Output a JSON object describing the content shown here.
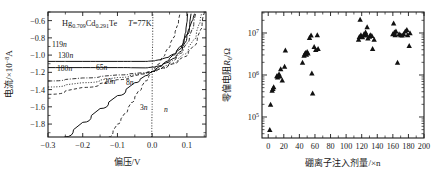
{
  "figure": {
    "panels": [
      "left",
      "right"
    ]
  },
  "left_panel": {
    "annotation_material": "Hg",
    "annotation_material_x": "0.709",
    "annotation_material_cd": "Cd",
    "annotation_material_cd_x": "0.291",
    "annotation_material_te": "Te",
    "annotation_temperature_symbol": "T",
    "annotation_temperature_value": "=77K",
    "xlabel": "偏压/V",
    "ylabel_main": "电流/×10",
    "ylabel_exp": "−8",
    "ylabel_unit": "A",
    "xticks": [
      "−0.3",
      "−0.2",
      "−0.1",
      "0.0",
      "0.1"
    ],
    "yticks": [
      "−0.6",
      "−0.8",
      "−1.0",
      "−1.2",
      "−1.4",
      "−1.6",
      "−1.8"
    ],
    "curve_labels": [
      "119n",
      "130n",
      "180n",
      "65n",
      "20n",
      "8n",
      "3n",
      "n"
    ]
  },
  "right_panel": {
    "xlabel": "硼离子注入剂量/×n",
    "ylabel_main": "零偏电阻",
    "ylabel_symbol": "R",
    "ylabel_sub": "0",
    "ylabel_unit": "/Ω",
    "xticks": [
      "0",
      "20",
      "40",
      "60",
      "80",
      "100",
      "120",
      "140",
      "160",
      "180",
      "200"
    ],
    "yticks": [
      "10",
      "10",
      "10"
    ],
    "ytick_exps": [
      "5",
      "6",
      "7"
    ]
  },
  "chart_data": [
    {
      "type": "line",
      "title": "Hg0.709Cd0.291Te T=77K current-voltage characteristics",
      "xlabel": "偏压/V",
      "ylabel": "电流/×10⁻⁸A",
      "xlim": [
        -0.3,
        0.155
      ],
      "ylim": [
        -1.95,
        -0.5
      ],
      "grid": false,
      "legend": "inline-curve-labels",
      "series": [
        {
          "name": "119n",
          "style": "solid",
          "points": [
            [
              -0.3,
              -1.073
            ],
            [
              -0.2,
              -1.073
            ],
            [
              -0.1,
              -1.073
            ],
            [
              -0.02,
              -1.073
            ],
            [
              0.0,
              -1.068
            ],
            [
              0.02,
              -1.055
            ],
            [
              0.04,
              -1.03
            ],
            [
              0.06,
              -0.99
            ],
            [
              0.08,
              -0.93
            ],
            [
              0.09,
              -0.86
            ],
            [
              0.095,
              -0.75
            ],
            [
              0.1,
              -0.62
            ],
            [
              0.102,
              -0.52
            ]
          ]
        },
        {
          "name": "130n",
          "style": "solid",
          "points": [
            [
              -0.3,
              -1.145
            ],
            [
              -0.2,
              -1.145
            ],
            [
              -0.1,
              -1.145
            ],
            [
              -0.02,
              -1.148
            ],
            [
              0.0,
              -1.14
            ],
            [
              0.02,
              -1.125
            ],
            [
              0.04,
              -1.09
            ],
            [
              0.06,
              -1.04
            ],
            [
              0.08,
              -0.96
            ],
            [
              0.095,
              -0.85
            ],
            [
              0.105,
              -0.7
            ],
            [
              0.112,
              -0.52
            ]
          ]
        },
        {
          "name": "180n",
          "style": "dashdot",
          "points": [
            [
              -0.3,
              -1.3
            ],
            [
              -0.2,
              -1.265
            ],
            [
              -0.1,
              -1.23
            ],
            [
              -0.03,
              -1.205
            ],
            [
              0.0,
              -1.19
            ],
            [
              0.02,
              -1.16
            ],
            [
              0.04,
              -1.12
            ],
            [
              0.06,
              -1.06
            ],
            [
              0.08,
              -0.98
            ],
            [
              0.1,
              -0.86
            ],
            [
              0.115,
              -0.7
            ],
            [
              0.125,
              -0.52
            ]
          ]
        },
        {
          "name": "65n",
          "style": "dot",
          "points": [
            [
              -0.3,
              -1.37
            ],
            [
              -0.2,
              -1.32
            ],
            [
              -0.1,
              -1.26
            ],
            [
              -0.03,
              -1.215
            ],
            [
              0.0,
              -1.19
            ],
            [
              0.03,
              -1.15
            ],
            [
              0.06,
              -1.09
            ],
            [
              0.09,
              -0.99
            ],
            [
              0.12,
              -0.82
            ],
            [
              0.135,
              -0.64
            ],
            [
              0.142,
              -0.52
            ]
          ]
        },
        {
          "name": "20n",
          "style": "dash",
          "points": [
            [
              -0.3,
              -1.455
            ],
            [
              -0.2,
              -1.375
            ],
            [
              -0.1,
              -1.285
            ],
            [
              -0.03,
              -1.22
            ],
            [
              0.0,
              -1.19
            ],
            [
              0.03,
              -1.15
            ],
            [
              0.06,
              -1.1
            ],
            [
              0.09,
              -1.02
            ],
            [
              0.12,
              -0.89
            ],
            [
              0.14,
              -0.7
            ],
            [
              0.148,
              -0.52
            ]
          ]
        },
        {
          "name": "8n",
          "style": "solid",
          "points": [
            [
              -0.253,
              -1.95
            ],
            [
              -0.2,
              -1.78
            ],
            [
              -0.15,
              -1.62
            ],
            [
              -0.1,
              -1.47
            ],
            [
              -0.05,
              -1.32
            ],
            [
              -0.02,
              -1.24
            ],
            [
              0.0,
              -1.19
            ],
            [
              0.02,
              -1.135
            ],
            [
              0.04,
              -1.075
            ],
            [
              0.06,
              -1.0
            ],
            [
              0.08,
              -0.9
            ],
            [
              0.1,
              -0.76
            ],
            [
              0.115,
              -0.6
            ],
            [
              0.122,
              -0.52
            ]
          ]
        },
        {
          "name": "3n",
          "style": "dash",
          "points": [
            [
              -0.125,
              -1.95
            ],
            [
              -0.1,
              -1.8
            ],
            [
              -0.08,
              -1.68
            ],
            [
              -0.06,
              -1.55
            ],
            [
              -0.04,
              -1.42
            ],
            [
              -0.02,
              -1.3
            ],
            [
              0.0,
              -1.19
            ],
            [
              0.015,
              -1.11
            ],
            [
              0.03,
              -1.02
            ],
            [
              0.045,
              -0.92
            ],
            [
              0.06,
              -0.8
            ],
            [
              0.072,
              -0.66
            ],
            [
              0.08,
              -0.52
            ]
          ]
        },
        {
          "name": "n",
          "style": "dot",
          "points": [
            [
              -0.002,
              -1.95
            ],
            [
              0.0,
              -1.6
            ],
            [
              0.0,
              -1.19
            ],
            [
              0.001,
              -0.9
            ],
            [
              0.002,
              -0.52
            ]
          ]
        }
      ]
    },
    {
      "type": "scatter",
      "title": "Zero-bias resistance vs boron implantation dose",
      "xlabel": "硼离子注入剂量/×n",
      "ylabel": "零偏电阻R0/Ω",
      "xlim": [
        -8,
        200
      ],
      "ylim": [
        31600,
        31600000
      ],
      "yscale": "log",
      "grid": false,
      "marker": "triangle-up",
      "points": [
        [
          2,
          50000
        ],
        [
          3,
          200000
        ],
        [
          5,
          430000
        ],
        [
          6,
          470000
        ],
        [
          7,
          520000
        ],
        [
          11,
          950000
        ],
        [
          12,
          880000
        ],
        [
          13,
          1000000
        ],
        [
          14,
          1050000
        ],
        [
          15,
          930000
        ],
        [
          16,
          1400000
        ],
        [
          18,
          750000
        ],
        [
          21,
          1600000
        ],
        [
          22,
          3900000
        ],
        [
          44,
          2000000
        ],
        [
          46,
          2900000
        ],
        [
          47,
          3200000
        ],
        [
          48,
          3400000
        ],
        [
          49,
          3100000
        ],
        [
          50,
          3600000
        ],
        [
          51,
          3300000
        ],
        [
          53,
          7700000
        ],
        [
          55,
          8800000
        ],
        [
          56,
          1100000
        ],
        [
          57,
          370000
        ],
        [
          59,
          4700000
        ],
        [
          61,
          4000000
        ],
        [
          63,
          9000000
        ],
        [
          64,
          4200000
        ],
        [
          116,
          7000000
        ],
        [
          117,
          8200000
        ],
        [
          118,
          21000000
        ],
        [
          119,
          9000000
        ],
        [
          121,
          8000000
        ],
        [
          123,
          9500000
        ],
        [
          124,
          8800000
        ],
        [
          125,
          10500000
        ],
        [
          126,
          9200000
        ],
        [
          127,
          14000000
        ],
        [
          128,
          7500000
        ],
        [
          130,
          8300000
        ],
        [
          131,
          9000000
        ],
        [
          133,
          8600000
        ],
        [
          134,
          4200000
        ],
        [
          136,
          7000000
        ],
        [
          160,
          9500000
        ],
        [
          161,
          17000000
        ],
        [
          162,
          10500000
        ],
        [
          163,
          9000000
        ],
        [
          164,
          11000000
        ],
        [
          166,
          2000000
        ],
        [
          168,
          9500000
        ],
        [
          170,
          9000000
        ],
        [
          172,
          8800000
        ],
        [
          174,
          9500000
        ],
        [
          176,
          11000000
        ],
        [
          178,
          12000000
        ],
        [
          179,
          9000000
        ],
        [
          181,
          5000000
        ],
        [
          182,
          10000000
        ]
      ]
    }
  ]
}
